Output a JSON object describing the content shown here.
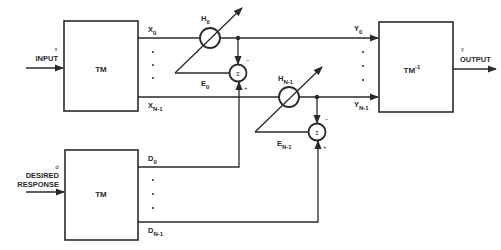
{
  "diagram": {
    "blocks": {
      "tm_top": {
        "label": "TM"
      },
      "tm_bottom": {
        "label": "TM"
      },
      "tm_inverse": {
        "label": "TM",
        "superscript": "-1"
      }
    },
    "inputs": {
      "input": {
        "symbol": "x",
        "label": "INPUT"
      },
      "desired": {
        "symbol": "d",
        "line1": "DESIRED",
        "line2": "RESPONSE"
      }
    },
    "output": {
      "symbol": "y",
      "label": "OUTPUT"
    },
    "signals": {
      "x0": {
        "base": "X",
        "sub": "0"
      },
      "xn1": {
        "base": "X",
        "sub": "N-1"
      },
      "y0": {
        "base": "Y",
        "sub": "0"
      },
      "yn1": {
        "base": "Y",
        "sub": "N-1"
      },
      "d0": {
        "base": "D",
        "sub": "0"
      },
      "dn1": {
        "base": "D",
        "sub": "N-1"
      },
      "e0": {
        "base": "E",
        "sub": "0"
      },
      "en1": {
        "base": "E",
        "sub": "N-1"
      }
    },
    "weights": {
      "h0": {
        "base": "H",
        "sub": "0"
      },
      "hn1": {
        "base": "H",
        "sub": "N-1"
      }
    },
    "summers": {
      "symbol": "Σ",
      "minus": "−",
      "plus": "+"
    },
    "ellipsis_dot": "·"
  }
}
